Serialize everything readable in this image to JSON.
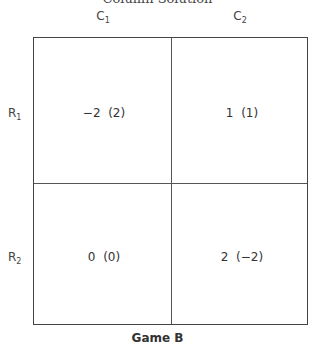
{
  "header": {
    "cut_off_title": "Column Solution"
  },
  "columns": [
    {
      "label": "C",
      "sub": "1"
    },
    {
      "label": "C",
      "sub": "2"
    }
  ],
  "rows": [
    {
      "label": "R",
      "sub": "1",
      "cells": [
        "−2  (2)",
        "1  (1)"
      ]
    },
    {
      "label": "R",
      "sub": "2",
      "cells": [
        "0  (0)",
        "2  (−2)"
      ]
    }
  ],
  "caption": "Game B"
}
